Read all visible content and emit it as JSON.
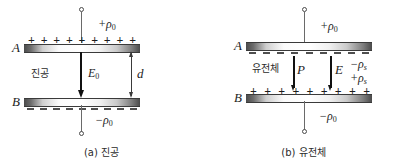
{
  "figure": {
    "type": "physics-diagram"
  },
  "panel_a": {
    "caption": "(a) 진공",
    "top_plate_letter": "A",
    "bottom_plate_letter": "B",
    "top_charge_label": "+ρ",
    "top_charge_sub": "0",
    "bottom_charge_label": "−ρ",
    "bottom_charge_sub": "0",
    "medium_label": "진공",
    "field_label": "E",
    "field_sub": "0",
    "gap_label": "d",
    "top_plate_signs": [
      "+",
      "+",
      "+",
      "+",
      "+",
      "+",
      "+",
      "+",
      "+"
    ],
    "bottom_plate_signs": [
      "–",
      "–",
      "–",
      "–",
      "–",
      "–",
      "–",
      "–",
      "–"
    ]
  },
  "panel_b": {
    "caption": "(b) 유전체",
    "top_plate_letter": "A",
    "bottom_plate_letter": "B",
    "top_charge_label": "+ρ",
    "top_charge_sub": "0",
    "bottom_charge_label": "−ρ",
    "bottom_charge_sub": "0",
    "medium_label": "유전체",
    "polarization_label": "P",
    "field_label": "E",
    "bound_neg_label": "−ρ",
    "bound_neg_sub": "s",
    "bound_pos_label": "+ρ",
    "bound_pos_sub": "s",
    "top_plate_signs": [
      "–",
      "–",
      "–",
      "–",
      "–",
      "–",
      "–",
      "–",
      "–"
    ],
    "bottom_plate_signs": [
      "+",
      "+",
      "+",
      "+",
      "+",
      "+",
      "+",
      "+",
      "+"
    ]
  },
  "colors": {
    "ink": "#1c1c1c",
    "plate_edge": "#4a4a4a",
    "plate_center": "#ffffff",
    "arrow": "#111111",
    "lead": "#6a6a6a",
    "background": "#ffffff"
  }
}
